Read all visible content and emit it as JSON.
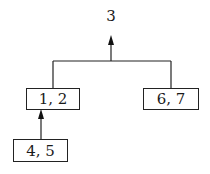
{
  "diagram": {
    "root_label": "3",
    "nodes": [
      {
        "id": "n12",
        "label": "1, 2"
      },
      {
        "id": "n67",
        "label": "6, 7"
      },
      {
        "id": "n45",
        "label": "4, 5"
      }
    ],
    "edges": [
      {
        "from": "n12",
        "to": "root",
        "type": "merged-arrow"
      },
      {
        "from": "n67",
        "to": "root",
        "type": "merged-arrow"
      },
      {
        "from": "n45",
        "to": "n12",
        "type": "arrow"
      }
    ]
  }
}
